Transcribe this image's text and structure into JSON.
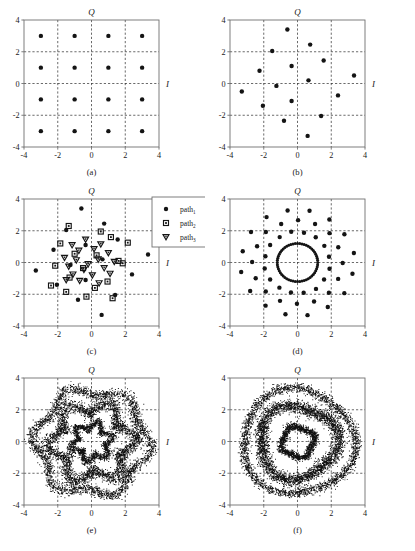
{
  "figure": {
    "axis_labels": {
      "q": "Q",
      "i": "I"
    },
    "tick_values": [
      "-4",
      "-2",
      "0",
      "2",
      "4"
    ],
    "axis_range": [
      -4,
      4
    ],
    "gridlines": [
      -2,
      0,
      2
    ],
    "panels": [
      {
        "id": "a",
        "caption": "(a)"
      },
      {
        "id": "b",
        "caption": "(b)"
      },
      {
        "id": "c",
        "caption": "(c)"
      },
      {
        "id": "d",
        "caption": "(d)"
      },
      {
        "id": "e",
        "caption": "(e)"
      },
      {
        "id": "f",
        "caption": "(f)"
      }
    ],
    "legend": {
      "entries": [
        {
          "marker": "filled-circle-icon",
          "base": "path",
          "sub": "1"
        },
        {
          "marker": "open-square-icon",
          "base": "path",
          "sub": "2"
        },
        {
          "marker": "open-triangle-down-icon",
          "base": "path",
          "sub": "3"
        }
      ]
    }
  },
  "chart_data": [
    {
      "id": "a",
      "type": "scatter",
      "title": "(a)",
      "xlabel": "I",
      "ylabel": "Q",
      "xlim": [
        -4,
        4
      ],
      "ylim": [
        -4,
        4
      ],
      "xticks": [
        -4,
        -2,
        0,
        2,
        4
      ],
      "yticks": [
        -4,
        -2,
        0,
        2,
        4
      ],
      "grid": true,
      "marker": "filled-circle",
      "description": "Ideal 16-QAM square constellation",
      "points": [
        [
          -3,
          3
        ],
        [
          -1,
          3
        ],
        [
          1,
          3
        ],
        [
          3,
          3
        ],
        [
          -3,
          1
        ],
        [
          -1,
          1
        ],
        [
          1,
          1
        ],
        [
          3,
          1
        ],
        [
          -3,
          -1
        ],
        [
          -1,
          -1
        ],
        [
          1,
          -1
        ],
        [
          3,
          -1
        ],
        [
          -3,
          -3
        ],
        [
          -1,
          -3
        ],
        [
          1,
          -3
        ],
        [
          3,
          -3
        ]
      ]
    },
    {
      "id": "b",
      "type": "scatter",
      "title": "(b)",
      "xlabel": "I",
      "ylabel": "Q",
      "xlim": [
        -4,
        4
      ],
      "ylim": [
        -4,
        4
      ],
      "xticks": [
        -4,
        -2,
        0,
        2,
        4
      ],
      "yticks": [
        -4,
        -2,
        0,
        2,
        4
      ],
      "grid": true,
      "marker": "filled-circle",
      "description": "Phase-rotated 16-point constellation after single path",
      "points": [
        [
          -0.6,
          3.4
        ],
        [
          0.75,
          2.45
        ],
        [
          -1.5,
          2.05
        ],
        [
          1.55,
          1.45
        ],
        [
          -2.25,
          0.8
        ],
        [
          -0.35,
          1.1
        ],
        [
          3.35,
          0.5
        ],
        [
          0.65,
          0.2
        ],
        [
          -1.25,
          -0.15
        ],
        [
          -3.3,
          -0.5
        ],
        [
          2.4,
          -0.75
        ],
        [
          -0.35,
          -1.1
        ],
        [
          -2.05,
          -1.4
        ],
        [
          1.4,
          -2.05
        ],
        [
          -0.8,
          -2.35
        ],
        [
          0.6,
          -3.3
        ]
      ]
    },
    {
      "id": "c",
      "type": "scatter",
      "title": "(c)",
      "xlabel": "I",
      "ylabel": "Q",
      "xlim": [
        -4,
        4
      ],
      "ylim": [
        -4,
        4
      ],
      "xticks": [
        -4,
        -2,
        0,
        2,
        4
      ],
      "yticks": [
        -4,
        -2,
        0,
        2,
        4
      ],
      "grid": true,
      "description": "Superposition of three multipath constellations",
      "legend_position": "outside-right",
      "series": [
        {
          "name": "path1",
          "marker": "filled-circle",
          "points": [
            [
              -0.6,
              3.4
            ],
            [
              0.75,
              2.45
            ],
            [
              -1.5,
              2.05
            ],
            [
              1.55,
              1.45
            ],
            [
              -2.25,
              0.8
            ],
            [
              -0.35,
              1.1
            ],
            [
              3.35,
              0.5
            ],
            [
              0.65,
              0.2
            ],
            [
              -1.25,
              -0.15
            ],
            [
              -3.3,
              -0.5
            ],
            [
              2.4,
              -0.75
            ],
            [
              -0.35,
              -1.1
            ],
            [
              -2.05,
              -1.4
            ],
            [
              1.4,
              -2.05
            ],
            [
              -0.8,
              -2.35
            ],
            [
              0.6,
              -3.3
            ]
          ]
        },
        {
          "name": "path2",
          "marker": "open-square",
          "points": [
            [
              -1.35,
              2.3
            ],
            [
              0.55,
              1.95
            ],
            [
              1.15,
              1.6
            ],
            [
              -1.85,
              1.2
            ],
            [
              2.15,
              1.25
            ],
            [
              -1.0,
              0.55
            ],
            [
              0.3,
              0.45
            ],
            [
              1.6,
              0.1
            ],
            [
              -2.15,
              -0.2
            ],
            [
              -0.5,
              -0.35
            ],
            [
              1.85,
              -0.05
            ],
            [
              -1.3,
              -0.95
            ],
            [
              0.95,
              -1.2
            ],
            [
              -2.4,
              -1.45
            ],
            [
              -1.5,
              -1.85
            ],
            [
              0.2,
              -1.6
            ],
            [
              1.25,
              -2.25
            ],
            [
              -0.3,
              -2.15
            ]
          ]
        },
        {
          "name": "path3",
          "marker": "open-triangle-down",
          "points": [
            [
              -0.35,
              1.45
            ],
            [
              0.55,
              1.15
            ],
            [
              -1.15,
              1.1
            ],
            [
              -0.75,
              0.75
            ],
            [
              0.15,
              0.85
            ],
            [
              1.0,
              0.6
            ],
            [
              -1.6,
              0.3
            ],
            [
              -0.9,
              0.15
            ],
            [
              0.4,
              0.2
            ],
            [
              1.35,
              0.05
            ],
            [
              -1.35,
              -0.25
            ],
            [
              -0.45,
              -0.45
            ],
            [
              0.75,
              -0.35
            ],
            [
              -1.1,
              -0.75
            ],
            [
              0.05,
              -0.8
            ],
            [
              1.1,
              -0.7
            ],
            [
              -0.7,
              -1.15
            ],
            [
              0.45,
              -1.3
            ],
            [
              -1.5,
              -1.1
            ],
            [
              -0.2,
              -0.1
            ]
          ]
        }
      ]
    },
    {
      "id": "d",
      "type": "scatter",
      "title": "(d)",
      "xlabel": "I",
      "ylabel": "Q",
      "xlim": [
        -4,
        4
      ],
      "ylim": [
        -4,
        4
      ],
      "xticks": [
        -4,
        -2,
        0,
        2,
        4
      ],
      "yticks": [
        -4,
        -2,
        0,
        2,
        4
      ],
      "grid": true,
      "marker": "filled-circle",
      "description": "Rotating-phase constellation forming concentric rings",
      "rings": [
        {
          "radius": 1.2,
          "count": 56
        },
        {
          "radius": 1.95,
          "count": 16
        },
        {
          "radius": 2.65,
          "count": 16
        },
        {
          "radius": 3.35,
          "count": 16
        }
      ]
    },
    {
      "id": "e",
      "type": "scatter",
      "title": "(e)",
      "xlabel": "I",
      "ylabel": "Q",
      "xlim": [
        -4,
        4
      ],
      "ylim": [
        -4,
        4
      ],
      "xticks": [
        -4,
        -2,
        0,
        2,
        4
      ],
      "yticks": [
        -4,
        -2,
        0,
        2,
        4
      ],
      "grid": true,
      "marker": "dense-dot",
      "description": "Dense received cloud, flower-shaped annular bands",
      "bands": [
        {
          "radius": 1.05,
          "thickness": 0.3,
          "lobes": 6,
          "lobe_amp": 0.22,
          "count": 1700
        },
        {
          "radius": 2.25,
          "thickness": 0.55,
          "lobes": 6,
          "lobe_amp": 0.4,
          "count": 3200
        },
        {
          "radius": 3.25,
          "thickness": 0.4,
          "lobes": 6,
          "lobe_amp": 0.32,
          "count": 2600
        }
      ]
    },
    {
      "id": "f",
      "type": "scatter",
      "title": "(f)",
      "xlabel": "I",
      "ylabel": "Q",
      "xlim": [
        -4,
        4
      ],
      "ylim": [
        -4,
        4
      ],
      "xticks": [
        -4,
        -2,
        0,
        2,
        4
      ],
      "yticks": [
        -4,
        -2,
        0,
        2,
        4
      ],
      "grid": true,
      "marker": "dense-dot",
      "description": "Dense received cloud, smooth concentric annular bands",
      "bands": [
        {
          "radius": 0.95,
          "thickness": 0.26,
          "lobes": 4,
          "lobe_amp": 0.1,
          "count": 1500
        },
        {
          "radius": 2.3,
          "thickness": 0.48,
          "lobes": 3,
          "lobe_amp": 0.18,
          "count": 3400
        },
        {
          "radius": 3.3,
          "thickness": 0.34,
          "lobes": 3,
          "lobe_amp": 0.16,
          "count": 2400
        }
      ]
    }
  ]
}
